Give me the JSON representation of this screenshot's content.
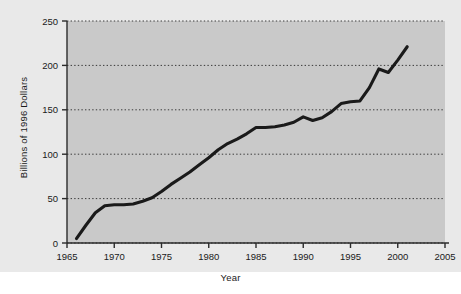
{
  "chart_data": {
    "type": "line",
    "title": "",
    "xlabel": "Year",
    "ylabel": "Billions of 1996 Dollars",
    "xlim": [
      1965,
      2005
    ],
    "ylim": [
      0,
      250
    ],
    "xticks": [
      1965,
      1970,
      1975,
      1980,
      1985,
      1990,
      1995,
      2000,
      2005
    ],
    "xtick_labels": [
      "1965",
      "1970",
      "1975",
      "1980",
      "1985",
      "1990",
      "1995",
      "2000",
      "2005"
    ],
    "yticks": [
      0,
      50,
      100,
      150,
      200,
      250
    ],
    "ytick_labels": [
      "0",
      "50",
      "100",
      "150",
      "200",
      "250"
    ],
    "grid": "horizontal-dotted",
    "legend": null,
    "series": [
      {
        "name": "Billions of 1996 Dollars",
        "color": "#1a1a1a",
        "x": [
          1966,
          1967,
          1968,
          1969,
          1970,
          1971,
          1972,
          1973,
          1974,
          1975,
          1976,
          1977,
          1978,
          1979,
          1980,
          1981,
          1982,
          1983,
          1984,
          1985,
          1986,
          1987,
          1988,
          1989,
          1990,
          1991,
          1992,
          1993,
          1994,
          1995,
          1996,
          1997,
          1998,
          1999,
          2000,
          2001
        ],
        "values": [
          5,
          20,
          34,
          42,
          43,
          43,
          44,
          47,
          51,
          58,
          66,
          73,
          80,
          88,
          96,
          105,
          112,
          117,
          123,
          130,
          130,
          131,
          133,
          136,
          142,
          138,
          141,
          148,
          157,
          159,
          160,
          175,
          196,
          192,
          206,
          221
        ]
      }
    ]
  },
  "axes": {
    "y_title": "Billions of 1996 Dollars",
    "x_title": "Year"
  },
  "style": {
    "plot_background": "#c9c9c9",
    "figure_background": "#e9e9e9",
    "line_color": "#1a1a1a",
    "grid_color": "#3a3a3a",
    "text_color": "#1a1a1a"
  }
}
